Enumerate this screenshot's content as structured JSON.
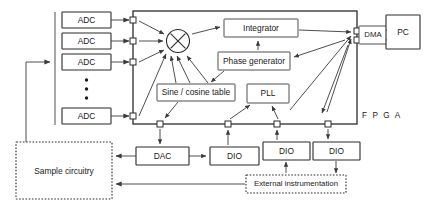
{
  "diagram": {
    "fpga_label": "F P G A",
    "colors": {
      "stroke": "#2b2b2b",
      "wire": "#3a3a3a",
      "background": "#ffffff",
      "text": "#1a1a1a"
    }
  },
  "inputs": {
    "adc_label": "ADC",
    "adcs": [
      {
        "label": "ADC"
      },
      {
        "label": "ADC"
      },
      {
        "label": "ADC"
      },
      {
        "label": "ADC"
      }
    ],
    "ellipsis_dots": 3
  },
  "fpga_blocks": {
    "multiplier": {
      "label": "",
      "symbol": "multiply-circle"
    },
    "integrator": {
      "label": "Integrator"
    },
    "phase_generator": {
      "label": "Phase generator"
    },
    "sine_cosine_table": {
      "label": "Sine / cosine table"
    },
    "pll": {
      "label": "PLL"
    },
    "dma": {
      "label": "DMA"
    }
  },
  "external": {
    "pc": {
      "label": "PC"
    },
    "dac": {
      "label": "DAC"
    },
    "dios": [
      {
        "label": "DIO"
      },
      {
        "label": "DIO"
      },
      {
        "label": "DIO"
      }
    ],
    "sample_circuitry": {
      "label": "Sample circuitry"
    },
    "external_instrumentation": {
      "label": "External instrumentation"
    }
  },
  "ports": {
    "left_count": 4,
    "bottom_count": 4,
    "right_count": 2
  }
}
